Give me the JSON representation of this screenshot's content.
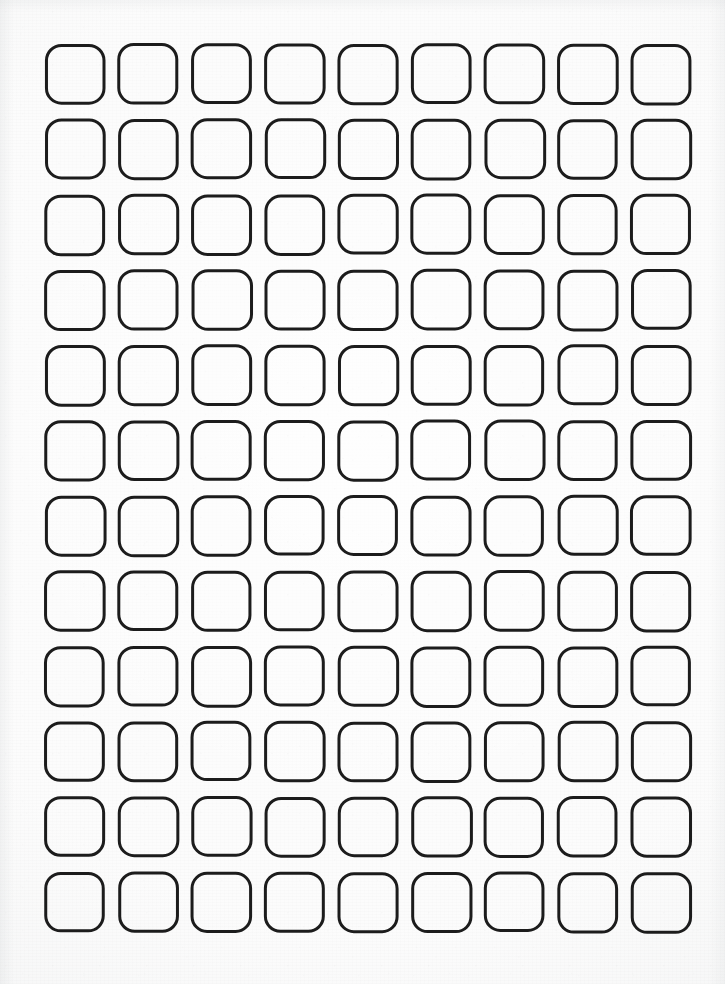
{
  "document": {
    "kind": "blank-grid-worksheet",
    "title": "Blank Rounded Square Grid",
    "description": "Printed sheet of empty rounded-square boxes arranged in a regular grid; all cells are blank.",
    "medium": "scanned paper",
    "page_width": 725,
    "page_height": 984
  },
  "colors": {
    "page_background": "#fafafa",
    "cell_stroke": "#1c1c1c",
    "cell_fill": "none",
    "edge_shadow": "#cdd0d2"
  },
  "grid": {
    "columns": 9,
    "rows": 12,
    "cell_count": 108,
    "cell_width": 58,
    "cell_height": 58,
    "corner_radius": 15,
    "stroke_width": 3,
    "column_pitch": 73.25,
    "row_pitch": 75.3,
    "origin_x": 46,
    "origin_y": 45,
    "margin_left": 46,
    "margin_top": 45,
    "margin_right": 35,
    "margin_bottom": 54,
    "cells_filled": 0,
    "cells_empty": 108,
    "cell_contents": [
      [
        "",
        "",
        "",
        "",
        "",
        "",
        "",
        "",
        ""
      ],
      [
        "",
        "",
        "",
        "",
        "",
        "",
        "",
        "",
        ""
      ],
      [
        "",
        "",
        "",
        "",
        "",
        "",
        "",
        "",
        ""
      ],
      [
        "",
        "",
        "",
        "",
        "",
        "",
        "",
        "",
        ""
      ],
      [
        "",
        "",
        "",
        "",
        "",
        "",
        "",
        "",
        ""
      ],
      [
        "",
        "",
        "",
        "",
        "",
        "",
        "",
        "",
        ""
      ],
      [
        "",
        "",
        "",
        "",
        "",
        "",
        "",
        "",
        ""
      ],
      [
        "",
        "",
        "",
        "",
        "",
        "",
        "",
        "",
        ""
      ],
      [
        "",
        "",
        "",
        "",
        "",
        "",
        "",
        "",
        ""
      ],
      [
        "",
        "",
        "",
        "",
        "",
        "",
        "",
        "",
        ""
      ],
      [
        "",
        "",
        "",
        "",
        "",
        "",
        "",
        "",
        ""
      ],
      [
        "",
        "",
        "",
        "",
        "",
        "",
        "",
        "",
        ""
      ]
    ]
  }
}
